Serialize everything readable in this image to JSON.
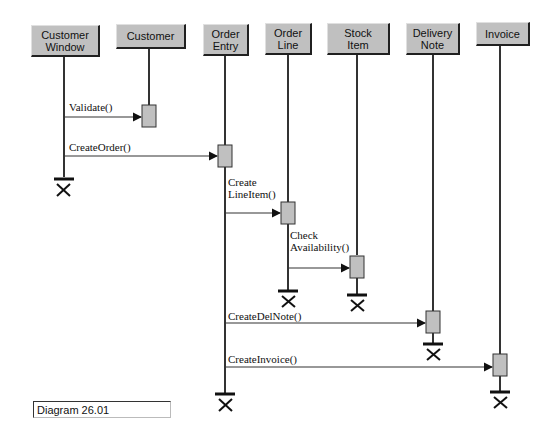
{
  "diagram": {
    "type": "UML sequence diagram",
    "caption": "Diagram 26.01",
    "objects": [
      {
        "id": "customer_window",
        "label": "Customer\nWindow"
      },
      {
        "id": "customer",
        "label": "Customer"
      },
      {
        "id": "order_entry",
        "label": "Order\nEntry"
      },
      {
        "id": "order_line",
        "label": "Order\nLine"
      },
      {
        "id": "stock_item",
        "label": "Stock\nItem"
      },
      {
        "id": "delivery_note",
        "label": "Delivery\nNote"
      },
      {
        "id": "invoice",
        "label": "Invoice"
      }
    ],
    "messages": [
      {
        "label": "Validate()",
        "from": "customer_window",
        "to": "customer"
      },
      {
        "label": "CreateOrder()",
        "from": "customer_window",
        "to": "order_entry"
      },
      {
        "label": "Create\nLineItem()",
        "from": "order_entry",
        "to": "order_line"
      },
      {
        "label": "Check\nAvailability()",
        "from": "order_line",
        "to": "stock_item"
      },
      {
        "label": "CreateDelNote()",
        "from": "order_entry",
        "to": "delivery_note"
      },
      {
        "label": "CreateInvoice()",
        "from": "order_entry",
        "to": "invoice"
      }
    ],
    "colors": {
      "header_fill": "#c0c0c0",
      "activation_fill": "#c0c0c0",
      "line": "#333333"
    }
  }
}
